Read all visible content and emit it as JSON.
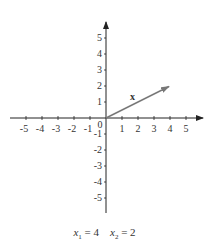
{
  "diagram": {
    "x_axis": {
      "ticks": [
        "-5",
        "-4",
        "-3",
        "-2",
        "-1",
        "1",
        "2",
        "3",
        "4",
        "5"
      ],
      "range": [
        -5,
        5
      ]
    },
    "y_axis": {
      "ticks": [
        "5",
        "4",
        "3",
        "2",
        "1",
        "-1",
        "-2",
        "-3",
        "-4",
        "-5"
      ],
      "range": [
        -5,
        5
      ]
    },
    "origin_label": "0",
    "vector": {
      "label": "x",
      "from": [
        0,
        0
      ],
      "to": [
        4,
        2
      ],
      "color": "#777777"
    },
    "caption": {
      "x1_var": "x",
      "x1_sub": "1",
      "x1_value": "= 4",
      "x2_var": "x",
      "x2_sub": "2",
      "x2_value": "= 2"
    }
  }
}
